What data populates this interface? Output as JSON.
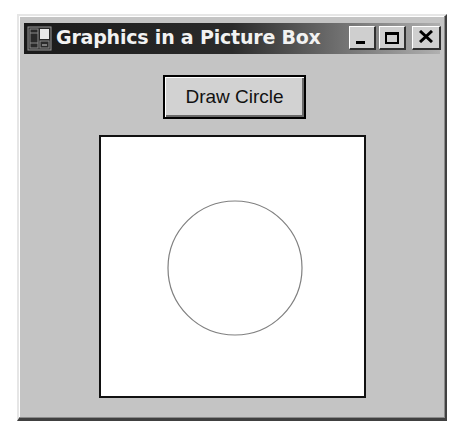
{
  "window": {
    "title": "Graphics in a Picture Box",
    "controls": {
      "minimize": "minimize",
      "maximize": "maximize",
      "close": "close"
    }
  },
  "toolbar": {
    "draw_button_label": "Draw Circle"
  },
  "picture_box": {
    "shape": "circle",
    "circle": {
      "cx": 134,
      "cy": 131,
      "r": 67,
      "stroke": "#808080"
    }
  },
  "colors": {
    "form_background": "#c4c4c4",
    "title_bar": "#1a1a1a",
    "picture_background": "#ffffff"
  }
}
